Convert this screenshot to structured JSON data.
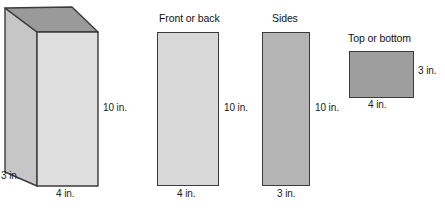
{
  "figure": {
    "kind": "geometry-diagram",
    "background_color": "#ffffff",
    "stroke_color": "#3b3b3b",
    "text_color": "#1a1a1a"
  },
  "units": "in.",
  "solid": {
    "name": "rectangular-prism",
    "dimensions": {
      "width": "4 in.",
      "depth": "3 in.",
      "height": "10 in."
    },
    "faces": {
      "top": {
        "name": "top-face",
        "fill": "#9a9a9a"
      },
      "left": {
        "name": "left-face",
        "fill": "#c6c6c6"
      },
      "front": {
        "name": "front-face",
        "fill": "#dedede"
      }
    },
    "labels": {
      "height": "10 in.",
      "width": "4 in.",
      "depth": "3 in."
    }
  },
  "net_faces": [
    {
      "id": "front-or-back",
      "title": "Front or back",
      "fill": "#d8d8d8",
      "width_label": "4 in.",
      "height_label": "10 in."
    },
    {
      "id": "sides",
      "title": "Sides",
      "fill": "#b4b4b4",
      "width_label": "3 in.",
      "height_label": "10 in."
    },
    {
      "id": "top-or-bottom",
      "title": "Top or bottom",
      "fill": "#9e9e9e",
      "width_label": "4 in.",
      "height_label": "3 in."
    }
  ]
}
